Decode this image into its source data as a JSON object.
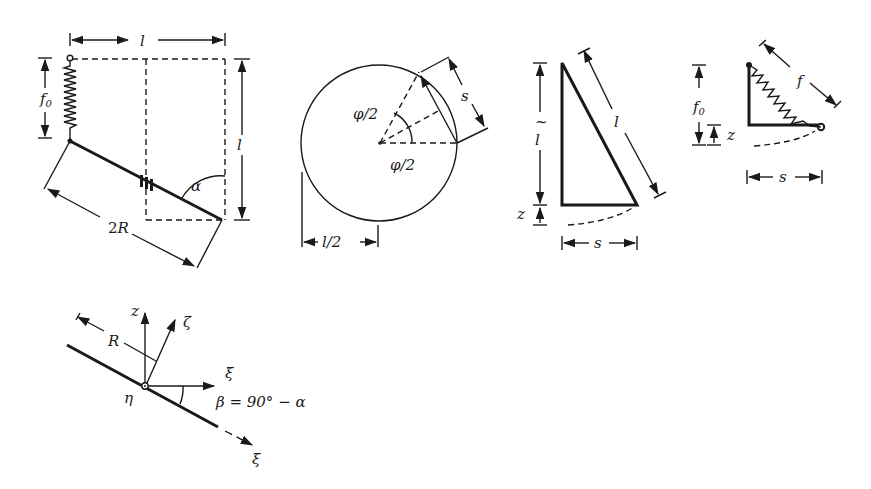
{
  "figure": {
    "panels": [
      {
        "id": "pendulum-spring-rod",
        "labels": {
          "top_width": "l",
          "right_height": "l",
          "spring_length": "f",
          "spring_sub": "0",
          "rod_length": "2R",
          "angle": "α"
        }
      },
      {
        "id": "circle-chord",
        "labels": {
          "upper_angle": "φ/2",
          "lower_angle": "φ/2",
          "chord": "s",
          "radius_dim": "l/2"
        }
      },
      {
        "id": "triangle-pendulum",
        "labels": {
          "vertical": "l",
          "vertical_tilde": "~",
          "hypotenuse": "l",
          "drop": "z",
          "horizontal": "s"
        }
      },
      {
        "id": "triangle-spring",
        "labels": {
          "spring": "f",
          "vertical": "f",
          "vertical_sub": "0",
          "drop": "z",
          "horizontal": "s"
        }
      },
      {
        "id": "coordinate-frame",
        "labels": {
          "z_axis": "z",
          "zeta_axis": "ζ",
          "xi_bar_axis": "ξ̄",
          "xi_axis": "ξ",
          "eta_axis": "η",
          "radius": "R",
          "beta_relation": "β = 90° − α"
        }
      }
    ]
  }
}
